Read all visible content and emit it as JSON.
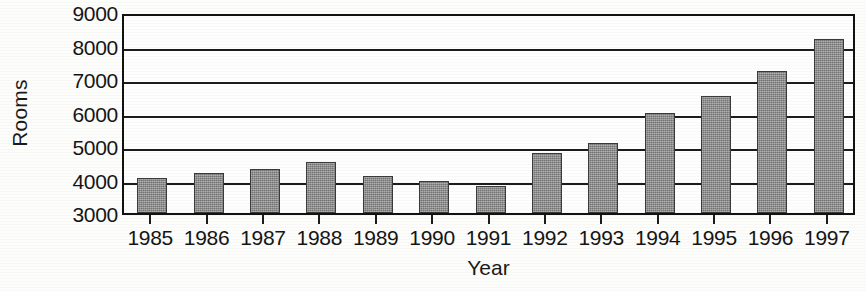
{
  "chart_data": {
    "type": "bar",
    "title": "",
    "xlabel": "Year",
    "ylabel": "Rooms",
    "categories": [
      "1985",
      "1986",
      "1987",
      "1988",
      "1989",
      "1990",
      "1991",
      "1992",
      "1993",
      "1994",
      "1995",
      "1996",
      "1997"
    ],
    "values": [
      4050,
      4200,
      4320,
      4520,
      4100,
      3950,
      3820,
      4800,
      5100,
      6000,
      6500,
      7250,
      8200
    ],
    "ylim": [
      3000,
      9000
    ],
    "y_ticks": [
      3000,
      4000,
      5000,
      6000,
      7000,
      8000,
      9000
    ],
    "y_tick_labels": [
      "3000",
      "4000",
      "5000",
      "6000",
      "7000",
      "8000",
      "9000"
    ],
    "grid": true,
    "grid_axis": "y",
    "legend": false,
    "legend_position": "none",
    "bar_color": "#8d8d8d",
    "bar_edge_color": "#3a3a3a",
    "axis_color": "#1c1c1c",
    "background_color": "#fefefe"
  }
}
